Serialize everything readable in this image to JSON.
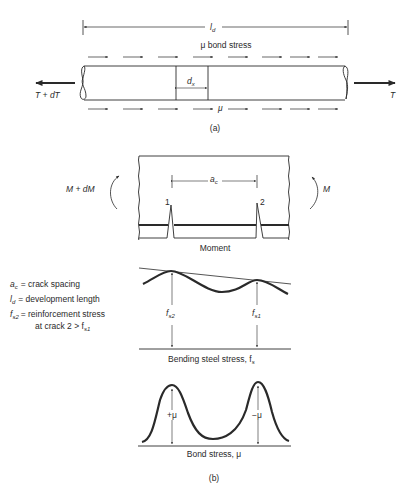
{
  "figure_a": {
    "dimension_label": "l",
    "dimension_label_sub": "d",
    "bond_stress_title": "μ bond stress",
    "element_label": "d",
    "element_label_sub": "x",
    "bottom_mu_label": "μ",
    "left_force": "T + dT",
    "right_force": "T",
    "caption": "(a)"
  },
  "figure_b": {
    "moment_panel": {
      "left_moment": "M + dM",
      "right_moment": "M",
      "crack_spacing_label": "a",
      "crack_spacing_sub": "c",
      "crack_1": "1",
      "crack_2": "2",
      "caption": "Moment"
    },
    "legend": [
      {
        "symbol": "a",
        "sub": "c",
        "text": "= crack spacing"
      },
      {
        "symbol": "l",
        "sub": "d",
        "text": "= development length"
      },
      {
        "symbol": "f",
        "sub": "s2",
        "text": "= reinforcement stress",
        "text2": "at crack 2 > f",
        "text2_sub": "s1"
      }
    ],
    "steel_stress_panel": {
      "left_label": "f",
      "left_label_sub": "s2",
      "right_label": "f",
      "right_label_sub": "s1",
      "caption": "Bending steel stress, f",
      "caption_sub": "s"
    },
    "bond_stress_panel": {
      "left_label": "+μ",
      "right_label": "−μ",
      "caption": "Bond stress, μ"
    },
    "caption": "(b)"
  }
}
